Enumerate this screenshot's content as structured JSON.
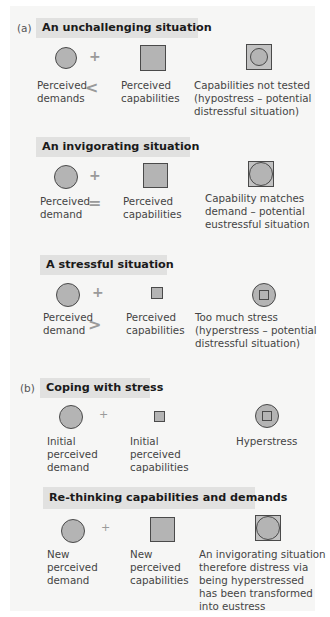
{
  "colors": {
    "shape_fill": "#b4b4b4",
    "shape_stroke": "#4a4a4a",
    "header_bg": "#e1e1e0",
    "panel_bg": "#f6f6f5"
  },
  "part_a": {
    "tag": "(a)",
    "sections": [
      {
        "title": "An unchallenging situation",
        "demand_label": "Perceived\ndemands",
        "operator": "<",
        "plus": "+",
        "capability_label": "Perceived\ncapabilities",
        "result_label": "Capabilities not tested\n(hypostress – potential\ndistressful situation)",
        "result_icon": "circle-in-square"
      },
      {
        "title": "An invigorating situation",
        "demand_label": "Perceived\ndemand",
        "operator": "=",
        "plus": "+",
        "capability_label": "Perceived\ncapabilities",
        "result_label": "Capability matches\ndemand – potential\neustressful situation",
        "result_icon": "circle-fits-square"
      },
      {
        "title": "A stressful situation",
        "demand_label": "Perceived\ndemand",
        "operator": ">",
        "plus": "+",
        "capability_label": "Perceived\ncapabilities",
        "result_label": "Too much stress\n(hyperstress – potential\ndistressful situation)",
        "result_icon": "square-in-circle"
      }
    ]
  },
  "part_b": {
    "tag": "(b)",
    "sections": [
      {
        "title": "Coping with stress",
        "plus": "+",
        "demand_label": "Initial\nperceived\ndemand",
        "capability_label": "Initial\nperceived\ncapabilities",
        "result_label": "Hyperstress",
        "result_icon": "square-in-circle"
      },
      {
        "title": "Re-thinking capabilities and demands",
        "plus": "+",
        "demand_label": "New\nperceived\ndemand",
        "capability_label": "New\nperceived\ncapabilities",
        "result_label": "An invigorating situation\ntherefore distress via\nbeing hyperstressed\nhas been transformed\ninto eustress",
        "result_icon": "circle-fits-square"
      }
    ]
  }
}
